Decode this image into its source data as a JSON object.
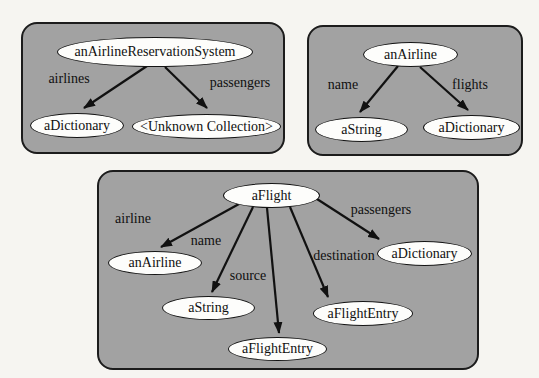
{
  "colors": {
    "background": "#f6f5f1",
    "panel_fill": "#a2a2a2",
    "panel_border": "#1c1c1c",
    "node_fill": "#fdfdfb",
    "node_border": "#141414",
    "arrow": "#111111",
    "text": "#101010"
  },
  "panels": [
    {
      "nodes": [
        {
          "label": "anAirlineReservationSystem"
        },
        {
          "label": "aDictionary"
        },
        {
          "label": "<Unknown Collection>"
        }
      ],
      "edges": [
        {
          "label": "airlines",
          "from": "anAirlineReservationSystem",
          "to": "aDictionary"
        },
        {
          "label": "passengers",
          "from": "anAirlineReservationSystem",
          "to": "<Unknown Collection>"
        }
      ]
    },
    {
      "nodes": [
        {
          "label": "anAirline"
        },
        {
          "label": "aString"
        },
        {
          "label": "aDictionary"
        }
      ],
      "edges": [
        {
          "label": "name",
          "from": "anAirline",
          "to": "aString"
        },
        {
          "label": "flights",
          "from": "anAirline",
          "to": "aDictionary"
        }
      ]
    },
    {
      "nodes": [
        {
          "label": "aFlight"
        },
        {
          "label": "anAirline"
        },
        {
          "label": "aString"
        },
        {
          "label": "aFlightEntry"
        },
        {
          "label": "aFlightEntry"
        },
        {
          "label": "aDictionary"
        }
      ],
      "edges": [
        {
          "label": "airline",
          "from": "aFlight",
          "to": "anAirline"
        },
        {
          "label": "name",
          "from": "aFlight",
          "to": "aString"
        },
        {
          "label": "source",
          "from": "aFlight",
          "to": "aFlightEntry"
        },
        {
          "label": "destination",
          "from": "aFlight",
          "to": "aFlightEntry"
        },
        {
          "label": "passengers",
          "from": "aFlight",
          "to": "aDictionary"
        }
      ]
    }
  ]
}
